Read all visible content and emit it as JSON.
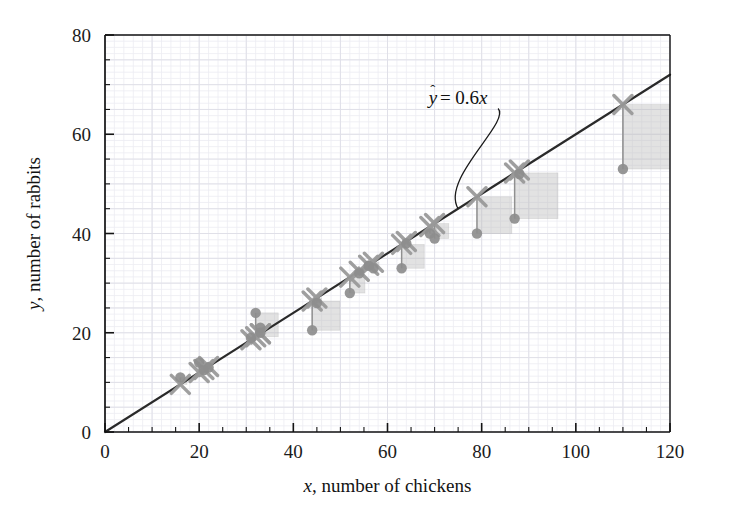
{
  "chart_data": {
    "type": "scatter",
    "title": "",
    "xlabel": "x, number of chickens",
    "ylabel": "y, number of rabbits",
    "xlabel_var": "x",
    "xlabel_rest": ", number of chickens",
    "ylabel_var": "y",
    "ylabel_rest": ", number of rabbits",
    "xlim": [
      0,
      120
    ],
    "ylim": [
      0,
      80
    ],
    "xticks": [
      0,
      20,
      40,
      60,
      80,
      100,
      120
    ],
    "yticks": [
      0,
      20,
      40,
      60,
      80
    ],
    "xtick_labels": [
      "0",
      "20",
      "40",
      "60",
      "80",
      "100",
      "120"
    ],
    "ytick_labels": [
      "0",
      "20",
      "40",
      "60",
      "80"
    ],
    "x_minor_step": 5,
    "y_minor_step": 5,
    "grid": true,
    "grid_minor_step_x": 2,
    "grid_minor_step_y": 1.25,
    "legend": "none",
    "annotation": {
      "text": "ŷ = 0.6x",
      "lhs": "y",
      "hat": "̂",
      "middle": " = 0.6",
      "rhs": "x",
      "x": 75,
      "y": 66,
      "leader_to_x": 75,
      "leader_to_y": 45
    },
    "fit_line": {
      "label": "ŷ = 0.6x",
      "slope": 0.6,
      "intercept": 0,
      "x_start": 0,
      "x_end": 120,
      "color": "#2a2a2a"
    },
    "series": [
      {
        "name": "observed",
        "marker": "circle",
        "color": "#8d8d8d",
        "x": [
          16,
          20,
          21,
          22,
          31,
          32,
          33,
          33,
          44,
          45,
          52,
          54,
          56,
          57,
          63,
          64,
          69,
          70,
          79,
          87,
          88,
          110
        ],
        "y": [
          11,
          14,
          12.5,
          13,
          19,
          24,
          21,
          20,
          20.5,
          26,
          28,
          32,
          33.5,
          33,
          33,
          38,
          40,
          39,
          40,
          43,
          52,
          53
        ]
      },
      {
        "name": "predicted",
        "marker": "cross",
        "color": "#9a9a9a",
        "x": [
          16,
          20,
          21,
          22,
          31,
          32,
          33,
          33,
          44,
          45,
          52,
          54,
          56,
          57,
          63,
          64,
          69,
          70,
          79,
          87,
          88,
          110
        ],
        "y": [
          9.6,
          12,
          12.6,
          13.2,
          18.6,
          19.2,
          19.8,
          19.8,
          26.4,
          27,
          31.2,
          32.4,
          33.6,
          34.2,
          37.8,
          38.4,
          41.4,
          42,
          47.4,
          52.2,
          52.8,
          66
        ]
      }
    ],
    "residual_squares": {
      "note": "side length equals absolute residual, drawn to the right of each predicted point",
      "fill": "#b9b9b9",
      "opacity": 0.42
    },
    "colors": {
      "line": "#2a2a2a",
      "observed_marker": "#8d8d8d",
      "predicted_marker": "#9a9a9a",
      "square_fill": "#b9b9b9",
      "grid_minor": "#ececf2",
      "grid_major": "#e0e0e8",
      "axis": "#141414",
      "text": "#141414",
      "background": "#ffffff"
    }
  }
}
